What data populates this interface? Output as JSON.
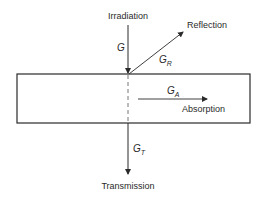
{
  "diagram": {
    "labels": {
      "irradiation": "Irradiation",
      "reflection": "Reflection",
      "absorption": "Absorption",
      "transmission": "Transmission"
    },
    "symbols": {
      "incident": {
        "base": "G",
        "sub": ""
      },
      "reflected": {
        "base": "G",
        "sub": "R"
      },
      "absorbed": {
        "base": "G",
        "sub": "A"
      },
      "transmitted": {
        "base": "G",
        "sub": "T"
      }
    },
    "colors": {
      "stroke": "#2a2a2a",
      "dashed": "#777777",
      "background": "#ffffff"
    }
  }
}
